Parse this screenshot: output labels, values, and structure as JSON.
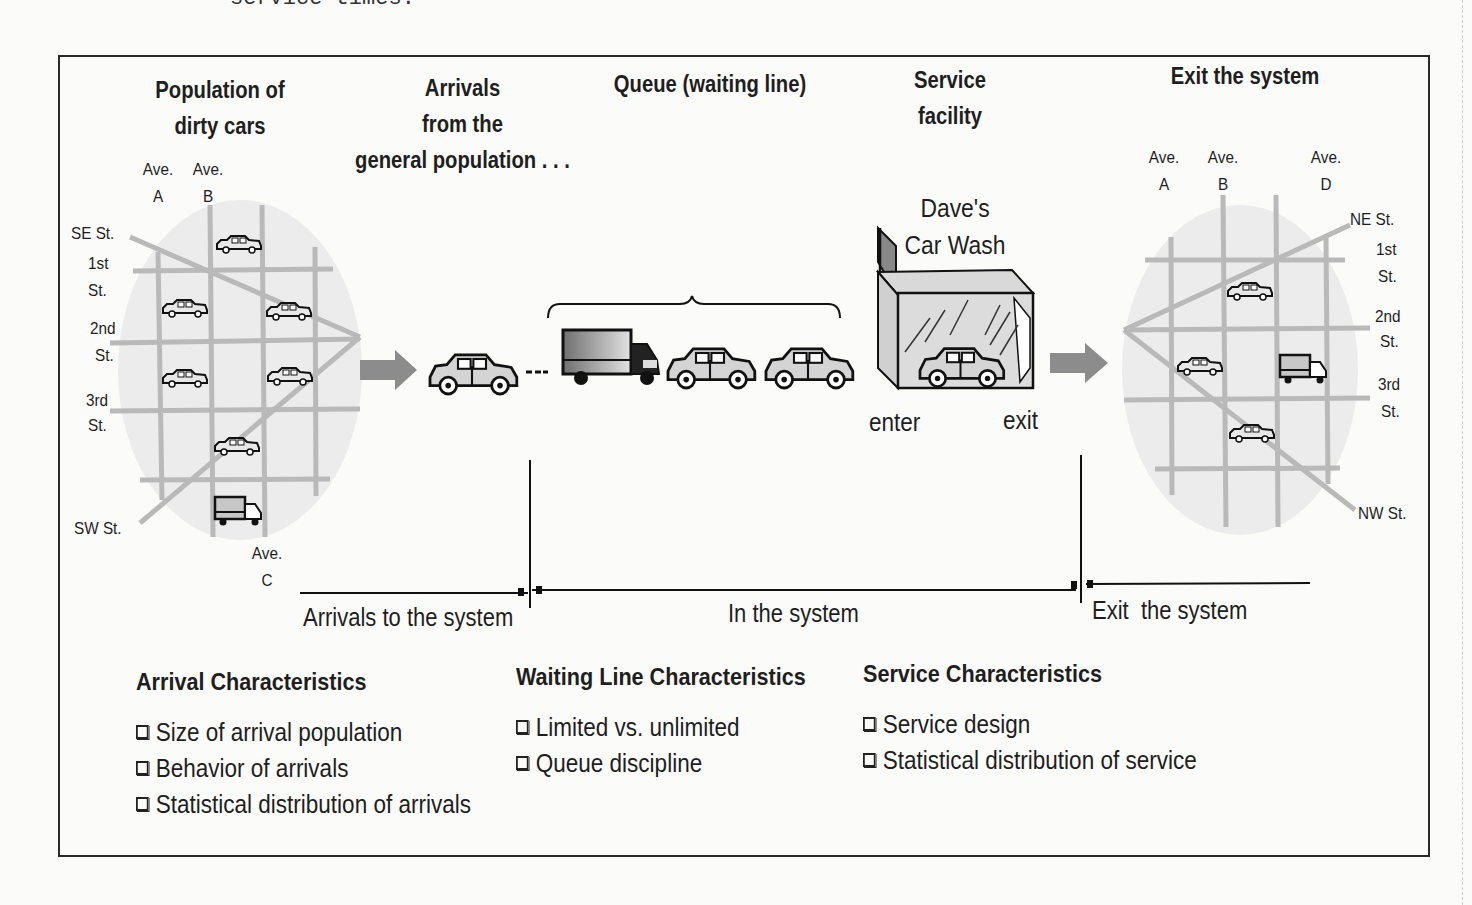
{
  "page": {
    "cut_text": "service times."
  },
  "stages": {
    "population": {
      "title_line1": "Population of",
      "title_line2": "dirty cars"
    },
    "arrivals": {
      "title_line1": "Arrivals",
      "title_line2": "from the",
      "title_line3": "general population . . ."
    },
    "queue": {
      "title": "Queue (waiting line)"
    },
    "service": {
      "title_line1": "Service",
      "title_line2": "facility",
      "name_line1": "Dave's",
      "name_line2": "Car Wash",
      "enter_label": "enter",
      "exit_label": "exit"
    },
    "exit": {
      "title": "Exit the system"
    }
  },
  "left_map": {
    "avenues": [
      {
        "line1": "Ave.",
        "line2": "A"
      },
      {
        "line1": "Ave.",
        "line2": "B"
      },
      {
        "line1": "Ave.",
        "line2": "C"
      }
    ],
    "streets": [
      "SE St.",
      "1st",
      "St.",
      "2nd",
      "St.",
      "3rd",
      "St.",
      "SW St."
    ]
  },
  "right_map": {
    "avenues": [
      {
        "line1": "Ave.",
        "line2": "A"
      },
      {
        "line1": "Ave.",
        "line2": "B"
      },
      {
        "line1": "Ave.",
        "line2": "D"
      }
    ],
    "streets": [
      "NE St.",
      "1st",
      "St.",
      "2nd",
      "St.",
      "3rd",
      "St.",
      "NW St."
    ]
  },
  "timeline": {
    "segments": [
      "Arrivals to the system",
      "In the system",
      "Exit  the system"
    ]
  },
  "characteristics": [
    {
      "title": "Arrival Characteristics",
      "items": [
        "Size of arrival population",
        "Behavior of arrivals",
        "Statistical distribution of arrivals"
      ]
    },
    {
      "title": "Waiting Line Characteristics",
      "items": [
        "Limited vs. unlimited",
        "Queue discipline"
      ]
    },
    {
      "title": "Service Characteristics",
      "items": [
        "Service design",
        "Statistical distribution of service"
      ]
    }
  ],
  "colors": {
    "frame": "#2a2a2a",
    "road": "#b9b9b9",
    "map_fill": "#ececec",
    "arrow": "#8c8c8c",
    "vehicle_fill": "#d4d4d4",
    "ink": "#1e1e1e"
  }
}
